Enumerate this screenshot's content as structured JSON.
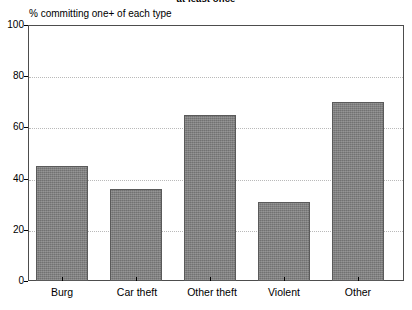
{
  "chart_data": {
    "type": "bar",
    "title": "at least once",
    "title_truncated": true,
    "ylabel": "% committing one+ of each type",
    "xlabel": "",
    "categories": [
      "Burg",
      "Car theft",
      "Other theft",
      "Violent",
      "Other"
    ],
    "values": [
      45,
      36,
      65,
      31,
      70
    ],
    "ylim": [
      0,
      100
    ],
    "yticks": [
      0,
      20,
      40,
      60,
      80,
      100
    ],
    "ytick_labels": [
      "0",
      "20",
      "40",
      "60",
      "80",
      "100"
    ],
    "grid": true,
    "grid_axis": "y",
    "grid_style": "dotted",
    "legend": false,
    "legend_position": "none",
    "bar_color": "#808080",
    "bar_edge_color": "#5a5a5a",
    "background_color": "#ffffff",
    "frame_color": "#4d4d4d"
  },
  "axis": {
    "y_tick_0": "0",
    "y_tick_1": "20",
    "y_tick_2": "40",
    "y_tick_3": "60",
    "y_tick_4": "80",
    "y_tick_5": "100"
  },
  "labels": {
    "cat_0": "Burg",
    "cat_1": "Car theft",
    "cat_2": "Other theft",
    "cat_3": "Violent",
    "cat_4": "Other"
  }
}
